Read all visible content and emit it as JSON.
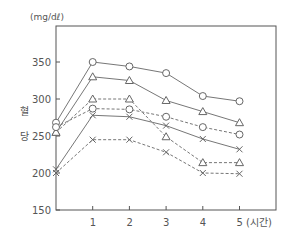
{
  "chart_data": {
    "type": "line",
    "title": "",
    "unit_label": "(mg/dℓ)",
    "xlabel": "(시간)",
    "ylabel": "혈 당",
    "ylabel_chars": [
      "혈",
      "당"
    ],
    "x": [
      0,
      1,
      2,
      3,
      4,
      5
    ],
    "x_tick_labels": [
      "1",
      "2",
      "3",
      "4",
      "5 (시간)"
    ],
    "y_ticks": [
      150,
      200,
      250,
      300,
      350
    ],
    "ylim": [
      150,
      390
    ],
    "xlim": [
      0,
      6
    ],
    "grid": false,
    "legend": "none",
    "series": [
      {
        "name": "solid-circle",
        "style": "solid",
        "marker": "circle",
        "values": [
          268,
          350,
          344,
          335,
          304,
          297
        ]
      },
      {
        "name": "solid-triangle",
        "style": "solid",
        "marker": "triangle",
        "values": [
          255,
          330,
          325,
          298,
          283,
          268
        ]
      },
      {
        "name": "dashed-triangle",
        "style": "dashed",
        "marker": "triangle",
        "values": [
          255,
          300,
          300,
          249,
          214,
          214
        ]
      },
      {
        "name": "dashed-circle",
        "style": "dashed",
        "marker": "circle",
        "values": [
          262,
          287,
          286,
          276,
          262,
          252
        ]
      },
      {
        "name": "solid-x",
        "style": "solid",
        "marker": "x",
        "values": [
          205,
          278,
          276,
          264,
          246,
          232
        ]
      },
      {
        "name": "dashed-x",
        "style": "dashed",
        "marker": "x",
        "values": [
          200,
          245,
          245,
          228,
          200,
          199
        ]
      }
    ]
  },
  "colors": {
    "line": "#666666",
    "axis": "#555555",
    "marker_fill": "#ffffff"
  }
}
